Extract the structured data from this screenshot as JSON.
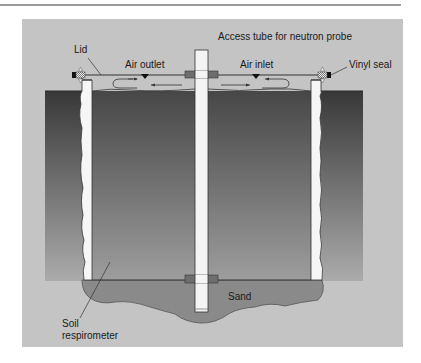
{
  "figure": {
    "title_label": "Access tube for neutron probe",
    "labels": {
      "lid": "Lid",
      "air_outlet": "Air outlet",
      "air_inlet": "Air inlet",
      "vinyl_seal": "Vinyl seal",
      "sand": "Sand",
      "soil_respirometer_line1": "Soil",
      "soil_respirometer_line2": "respirometer"
    },
    "colors": {
      "frame_background": "#c4c4c4",
      "soil_top": "#3c3c3c",
      "soil_bottom": "#a8a8a8",
      "chamber_top": "#4a4a4a",
      "chamber_bottom": "#9c9c9c",
      "sand": "#8a8a8a",
      "tube": "#f4f4f4",
      "collar": "#6e6e6e",
      "rule": "#9a9a9a"
    }
  }
}
